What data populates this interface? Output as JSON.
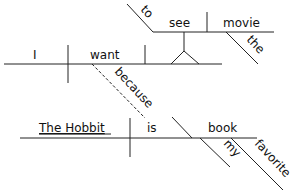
{
  "diagram": {
    "type": "Reed-Kellogg sentence diagram",
    "main_clause": {
      "subject": "I",
      "verb": "want",
      "infinitive_object": {
        "marker": "to",
        "verb": "see",
        "object": "movie",
        "object_modifier": "the"
      }
    },
    "connector": "because",
    "sub_clause": {
      "subject": "The Hobbit",
      "verb": "is",
      "complement": "book",
      "complement_modifiers": [
        "my",
        "favorite"
      ]
    }
  }
}
